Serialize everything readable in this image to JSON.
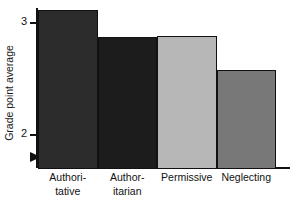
{
  "chart_data": {
    "type": "bar",
    "title": "",
    "subtitle": "",
    "xlabel": "",
    "ylabel": "Grade point average",
    "categories": [
      "Authoritative",
      "Authoritarian",
      "Permissive",
      "Neglecting"
    ],
    "category_labels_wrapped": [
      "Authori-\ntative",
      "Author-\nitarian",
      "Permissive",
      "Neglecting"
    ],
    "values": [
      3.11,
      2.87,
      2.88,
      2.58
    ],
    "ylim": [
      1.71,
      3.2
    ],
    "y_ticks": [
      2,
      3
    ],
    "y_tick_labels": [
      "2",
      "3"
    ],
    "grid": false,
    "legend": false,
    "axis_break": true,
    "bar_colors": [
      "#2c2c2c",
      "#1c1c1c",
      "#b7b7b7",
      "#787878"
    ],
    "bar_edge_color": "#111111",
    "axis_color": "#111111",
    "background": "#ffffff"
  },
  "axes": {
    "y_title": "Grade point average",
    "y_tick_2": "2",
    "y_tick_3": "3"
  },
  "x_labels": {
    "bar0_line1": "Authori-",
    "bar0_line2": "tative",
    "bar1_line1": "Author-",
    "bar1_line2": "itarian",
    "bar2_line1": "Permissive",
    "bar3_line1": "Neglecting"
  }
}
